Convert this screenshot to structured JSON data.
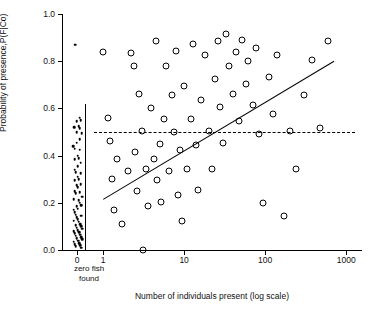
{
  "chart_data": {
    "type": "scatter",
    "title": "",
    "xlabel": "Number of individuals present (log scale)",
    "ylabel": "Probability of presence,P(F|Co)",
    "ylim": [
      0.0,
      1.0
    ],
    "yticks": [
      0.0,
      0.2,
      0.4,
      0.6,
      0.8,
      1.0
    ],
    "ytick_labels": [
      "0.0",
      "0.2",
      "0.4",
      "0.6",
      "0.8",
      "1.0"
    ],
    "xscale": "log",
    "xticks": [
      1,
      10,
      100,
      1000
    ],
    "xtick_labels": [
      "1",
      "10",
      "100",
      "1000"
    ],
    "zero_category_label": "0",
    "zero_category_note": "zero fish found",
    "grid": false,
    "legend": null,
    "series": [
      {
        "name": "zero fish found (filled dots)",
        "marker": "filled-dot",
        "points": [
          {
            "x": 0,
            "y": 0.87
          },
          {
            "x": 0,
            "y": 0.56
          },
          {
            "x": 0,
            "y": 0.55
          },
          {
            "x": 0,
            "y": 0.545
          },
          {
            "x": 0,
            "y": 0.525
          },
          {
            "x": 0,
            "y": 0.52
          },
          {
            "x": 0,
            "y": 0.515
          },
          {
            "x": 0,
            "y": 0.5
          },
          {
            "x": 0,
            "y": 0.495
          },
          {
            "x": 0,
            "y": 0.47
          },
          {
            "x": 0,
            "y": 0.455
          },
          {
            "x": 0,
            "y": 0.44
          },
          {
            "x": 0,
            "y": 0.43
          },
          {
            "x": 0,
            "y": 0.425
          },
          {
            "x": 0,
            "y": 0.4
          },
          {
            "x": 0,
            "y": 0.39
          },
          {
            "x": 0,
            "y": 0.385
          },
          {
            "x": 0,
            "y": 0.37
          },
          {
            "x": 0,
            "y": 0.355
          },
          {
            "x": 0,
            "y": 0.34
          },
          {
            "x": 0,
            "y": 0.33
          },
          {
            "x": 0,
            "y": 0.325
          },
          {
            "x": 0,
            "y": 0.31
          },
          {
            "x": 0,
            "y": 0.3
          },
          {
            "x": 0,
            "y": 0.295
          },
          {
            "x": 0,
            "y": 0.28
          },
          {
            "x": 0,
            "y": 0.275
          },
          {
            "x": 0,
            "y": 0.265
          },
          {
            "x": 0,
            "y": 0.25
          },
          {
            "x": 0,
            "y": 0.245
          },
          {
            "x": 0,
            "y": 0.24
          },
          {
            "x": 0,
            "y": 0.225
          },
          {
            "x": 0,
            "y": 0.215
          },
          {
            "x": 0,
            "y": 0.21
          },
          {
            "x": 0,
            "y": 0.2
          },
          {
            "x": 0,
            "y": 0.19
          },
          {
            "x": 0,
            "y": 0.185
          },
          {
            "x": 0,
            "y": 0.175
          },
          {
            "x": 0,
            "y": 0.17
          },
          {
            "x": 0,
            "y": 0.16
          },
          {
            "x": 0,
            "y": 0.15
          },
          {
            "x": 0,
            "y": 0.145
          },
          {
            "x": 0,
            "y": 0.14
          },
          {
            "x": 0,
            "y": 0.13
          },
          {
            "x": 0,
            "y": 0.125
          },
          {
            "x": 0,
            "y": 0.12
          },
          {
            "x": 0,
            "y": 0.11
          },
          {
            "x": 0,
            "y": 0.105
          },
          {
            "x": 0,
            "y": 0.1
          },
          {
            "x": 0,
            "y": 0.095
          },
          {
            "x": 0,
            "y": 0.09
          },
          {
            "x": 0,
            "y": 0.085
          },
          {
            "x": 0,
            "y": 0.08
          },
          {
            "x": 0,
            "y": 0.075
          },
          {
            "x": 0,
            "y": 0.07
          },
          {
            "x": 0,
            "y": 0.065
          },
          {
            "x": 0,
            "y": 0.06
          },
          {
            "x": 0,
            "y": 0.055
          },
          {
            "x": 0,
            "y": 0.05
          },
          {
            "x": 0,
            "y": 0.045
          },
          {
            "x": 0,
            "y": 0.04
          },
          {
            "x": 0,
            "y": 0.035
          },
          {
            "x": 0,
            "y": 0.03
          },
          {
            "x": 0,
            "y": 0.025
          },
          {
            "x": 0,
            "y": 0.02
          },
          {
            "x": 0,
            "y": 0.015
          },
          {
            "x": 0,
            "y": 0.01
          }
        ]
      },
      {
        "name": "fish present (open circles)",
        "marker": "open-circle",
        "points": [
          {
            "x": 1.0,
            "y": 0.84
          },
          {
            "x": 1.15,
            "y": 0.56
          },
          {
            "x": 1.2,
            "y": 0.46
          },
          {
            "x": 1.3,
            "y": 0.3
          },
          {
            "x": 1.35,
            "y": 0.17
          },
          {
            "x": 1.5,
            "y": 0.385
          },
          {
            "x": 1.7,
            "y": 0.11
          },
          {
            "x": 2.0,
            "y": 0.335
          },
          {
            "x": 2.2,
            "y": 0.835
          },
          {
            "x": 2.4,
            "y": 0.78
          },
          {
            "x": 2.5,
            "y": 0.415
          },
          {
            "x": 2.6,
            "y": 0.25
          },
          {
            "x": 2.8,
            "y": 0.66
          },
          {
            "x": 3.0,
            "y": 0.505
          },
          {
            "x": 3.1,
            "y": 0.0
          },
          {
            "x": 3.4,
            "y": 0.345
          },
          {
            "x": 3.6,
            "y": 0.185
          },
          {
            "x": 3.9,
            "y": 0.6
          },
          {
            "x": 4.2,
            "y": 0.385
          },
          {
            "x": 4.5,
            "y": 0.885
          },
          {
            "x": 4.6,
            "y": 0.295
          },
          {
            "x": 5.0,
            "y": 0.45
          },
          {
            "x": 5.2,
            "y": 0.205
          },
          {
            "x": 5.6,
            "y": 0.555
          },
          {
            "x": 6.0,
            "y": 0.78
          },
          {
            "x": 6.5,
            "y": 0.335
          },
          {
            "x": 7.0,
            "y": 0.655
          },
          {
            "x": 7.4,
            "y": 0.5
          },
          {
            "x": 8.0,
            "y": 0.845
          },
          {
            "x": 8.5,
            "y": 0.235
          },
          {
            "x": 9.0,
            "y": 0.425
          },
          {
            "x": 9.5,
            "y": 0.125
          },
          {
            "x": 10.0,
            "y": 0.695
          },
          {
            "x": 11.0,
            "y": 0.345
          },
          {
            "x": 12.0,
            "y": 0.555
          },
          {
            "x": 13.0,
            "y": 0.875
          },
          {
            "x": 14.0,
            "y": 0.445
          },
          {
            "x": 15.0,
            "y": 0.255
          },
          {
            "x": 16.0,
            "y": 0.635
          },
          {
            "x": 18.0,
            "y": 0.825
          },
          {
            "x": 20.0,
            "y": 0.505
          },
          {
            "x": 22.0,
            "y": 0.345
          },
          {
            "x": 24.0,
            "y": 0.725
          },
          {
            "x": 26.0,
            "y": 0.885
          },
          {
            "x": 28.0,
            "y": 0.605
          },
          {
            "x": 30.0,
            "y": 0.455
          },
          {
            "x": 33.0,
            "y": 0.915
          },
          {
            "x": 36.0,
            "y": 0.78
          },
          {
            "x": 40.0,
            "y": 0.66
          },
          {
            "x": 44.0,
            "y": 0.84
          },
          {
            "x": 48.0,
            "y": 0.545
          },
          {
            "x": 52.0,
            "y": 0.89
          },
          {
            "x": 58.0,
            "y": 0.705
          },
          {
            "x": 62.0,
            "y": 0.8
          },
          {
            "x": 70.0,
            "y": 0.615
          },
          {
            "x": 78.0,
            "y": 0.855
          },
          {
            "x": 85.0,
            "y": 0.49
          },
          {
            "x": 95.0,
            "y": 0.2
          },
          {
            "x": 110.0,
            "y": 0.735
          },
          {
            "x": 125.0,
            "y": 0.575
          },
          {
            "x": 140.0,
            "y": 0.825
          },
          {
            "x": 170.0,
            "y": 0.145
          },
          {
            "x": 200.0,
            "y": 0.505
          },
          {
            "x": 240.0,
            "y": 0.345
          },
          {
            "x": 300.0,
            "y": 0.655
          },
          {
            "x": 380.0,
            "y": 0.805
          },
          {
            "x": 480.0,
            "y": 0.515
          },
          {
            "x": 600.0,
            "y": 0.885
          }
        ]
      }
    ],
    "fit_line": {
      "style": "solid",
      "description": "increasing logistic/linear fit on log x",
      "x_start": 1.0,
      "y_start": 0.215,
      "x_end": 700.0,
      "y_end": 0.8
    },
    "reference_line": {
      "style": "dashed",
      "description": "horizontal reference at P = 0.50",
      "y": 0.5,
      "x_start": 0,
      "x_end": 1000
    }
  }
}
